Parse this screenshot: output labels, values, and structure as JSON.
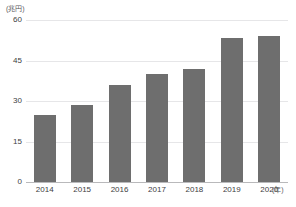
{
  "chart_data": {
    "type": "bar",
    "title": "",
    "subtitle": "",
    "xlabel": "(年)",
    "ylabel": "(兆円)",
    "categories": [
      "2014",
      "2015",
      "2016",
      "2017",
      "2018",
      "2019",
      "2020"
    ],
    "values": [
      25,
      28.5,
      36,
      40,
      42,
      53.5,
      54
    ],
    "series": [
      {
        "name": "",
        "values": [
          25,
          28.5,
          36,
          40,
          42,
          53.5,
          54
        ]
      }
    ],
    "ylim": [
      0,
      60
    ],
    "yticks": [
      0,
      15,
      30,
      45,
      60
    ],
    "ytick_labels": [
      "0",
      "15",
      "30",
      "45",
      "60"
    ],
    "grid": true,
    "grid_axis": "y",
    "legend": false,
    "legend_position": "none",
    "bar_color": "#6e6e6e",
    "gridline_color": "#e6e6e8",
    "baseline_color": "#b9b9bb",
    "text_color": "#404042",
    "background": "#ffffff"
  },
  "axes": {
    "y_unit_caption": "(兆円)",
    "x_unit_caption": "(年)"
  }
}
